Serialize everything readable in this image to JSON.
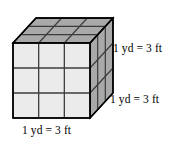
{
  "figure": {
    "name": "cubic-yard-unit-cube",
    "labels": {
      "height": "1 yd = 3 ft",
      "depth": "1 yd = 3 ft",
      "width": "1 yd = 3 ft"
    },
    "colors": {
      "front_face": "#ebebeb",
      "top_face": "#a9a9a9",
      "right_face": "#a9a9a9",
      "outline": "#000000",
      "grid_line": "#3c3c3c",
      "background": "#ffffff",
      "text": "#000000"
    },
    "geometry": {
      "divisions": 3,
      "front": {
        "x": 13,
        "y": 43,
        "w": 77,
        "h": 75
      },
      "depth_offset": {
        "dx": 23,
        "dy": -25
      }
    }
  }
}
